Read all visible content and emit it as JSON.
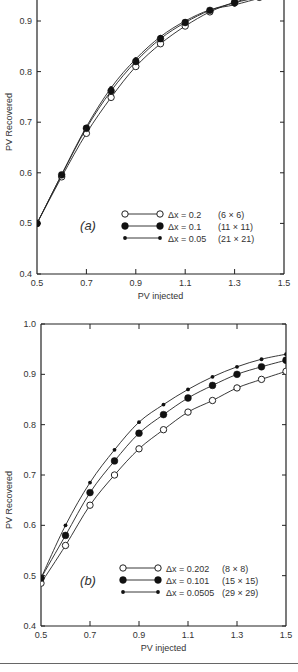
{
  "chart_data": [
    {
      "type": "line",
      "panel_label": "(a)",
      "title": "",
      "xlabel": "PV injected",
      "ylabel": "PV Recovered",
      "xlim": [
        0.5,
        1.5
      ],
      "ylim": [
        0.4,
        0.95
      ],
      "xticks": [
        0.5,
        0.7,
        0.9,
        1.1,
        1.3,
        1.5
      ],
      "yticks": [
        0.4,
        0.5,
        0.6,
        0.7,
        0.8,
        0.9
      ],
      "grid": false,
      "legend_position": "lower right",
      "frame": {
        "left": 37,
        "right": 284,
        "top": -7,
        "bottom": 274,
        "y_top_value": 0.955
      },
      "series": [
        {
          "name": "Δx = 0.2",
          "grid": "(6 × 6)",
          "marker": "open",
          "x": [
            0.5,
            0.6,
            0.7,
            0.8,
            0.9,
            1.0,
            1.1,
            1.2,
            1.3,
            1.4
          ],
          "values": [
            0.5,
            0.592,
            0.678,
            0.749,
            0.81,
            0.855,
            0.89,
            0.918,
            0.937,
            0.95
          ]
        },
        {
          "name": "Δx = 0.1",
          "grid": "(11 × 11)",
          "marker": "filled",
          "x": [
            0.5,
            0.6,
            0.7,
            0.8,
            0.9,
            1.0,
            1.1,
            1.2,
            1.3,
            1.4
          ],
          "values": [
            0.5,
            0.596,
            0.688,
            0.762,
            0.82,
            0.865,
            0.897,
            0.921,
            0.936,
            0.947
          ]
        },
        {
          "name": "Δx = 0.05",
          "grid": "(21 × 21)",
          "marker": "small",
          "x": [
            0.5,
            0.6,
            0.7,
            0.8,
            0.9,
            1.0,
            1.1,
            1.2,
            1.3,
            1.4
          ],
          "values": [
            0.5,
            0.597,
            0.691,
            0.768,
            0.825,
            0.869,
            0.9,
            0.922,
            0.932,
            0.945
          ]
        }
      ]
    },
    {
      "type": "line",
      "panel_label": "(b)",
      "title": "",
      "xlabel": "PV injected",
      "ylabel": "PV Recovered",
      "xlim": [
        0.5,
        1.5
      ],
      "ylim": [
        0.4,
        1.0
      ],
      "xticks": [
        0.5,
        0.7,
        0.9,
        1.1,
        1.3,
        1.5
      ],
      "yticks": [
        0.4,
        0.5,
        0.6,
        0.7,
        0.8,
        0.9,
        1.0
      ],
      "grid": false,
      "legend_position": "lower right",
      "frame": {
        "left": 41,
        "right": 286,
        "top": 324,
        "bottom": 626,
        "y_top_value": 1.0
      },
      "series": [
        {
          "name": "Δx = 0.202",
          "grid": "(8 × 8)",
          "marker": "open",
          "x": [
            0.5,
            0.6,
            0.7,
            0.8,
            0.9,
            1.0,
            1.1,
            1.2,
            1.3,
            1.4,
            1.5
          ],
          "values": [
            0.485,
            0.56,
            0.64,
            0.7,
            0.752,
            0.79,
            0.825,
            0.848,
            0.873,
            0.89,
            0.906
          ]
        },
        {
          "name": "Δx = 0.101",
          "grid": "(15 × 15)",
          "marker": "filled",
          "x": [
            0.5,
            0.6,
            0.7,
            0.8,
            0.9,
            1.0,
            1.1,
            1.2,
            1.3,
            1.4,
            1.5
          ],
          "values": [
            0.495,
            0.58,
            0.665,
            0.728,
            0.783,
            0.82,
            0.853,
            0.878,
            0.9,
            0.915,
            0.928
          ]
        },
        {
          "name": "Δx = 0.0505",
          "grid": "(29 × 29)",
          "marker": "small",
          "x": [
            0.5,
            0.6,
            0.7,
            0.8,
            0.9,
            1.0,
            1.1,
            1.2,
            1.3,
            1.4,
            1.5
          ],
          "values": [
            0.495,
            0.6,
            0.685,
            0.75,
            0.805,
            0.84,
            0.87,
            0.895,
            0.915,
            0.93,
            0.94
          ]
        }
      ]
    }
  ]
}
